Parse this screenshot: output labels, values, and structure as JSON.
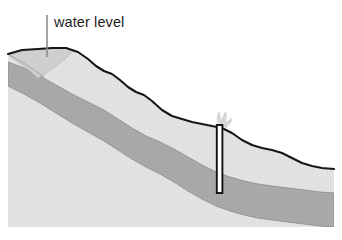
{
  "figure": {
    "width": 342,
    "height": 240,
    "background": "#ffffff"
  },
  "annotations": {
    "water_level": {
      "label": "water level",
      "text_x": 54,
      "text_y": 27,
      "leader_line": {
        "x": 47,
        "y_top": 15,
        "y_bottom": 57,
        "color": "#8c8c8c",
        "width": 1.6
      }
    }
  },
  "layers": {
    "surface_line": {
      "name": "ground-surface",
      "color": "#161616",
      "width": 2.1
    },
    "unsaturated_zone": {
      "name": "upper-soil",
      "color": "#e2e2e2",
      "edge": "#c9c9c9"
    },
    "saturated_wedge": {
      "name": "water-table-wedge",
      "color": "#cfcfcf",
      "edge": "#b3b3b3"
    },
    "aquifer": {
      "name": "confined-aquifer",
      "color": "#a9a9a9",
      "edge": "#8f8f8f"
    },
    "bedrock": {
      "name": "lower-bedrock",
      "color": "#e2e2e2",
      "edge": "#cccccc"
    }
  },
  "well": {
    "name": "artesian-well",
    "x_left": 216.5,
    "x_right": 222.5,
    "y_top": 125,
    "y_bottom": 193,
    "casing_color": "#111111",
    "bore_color": "#ffffff",
    "casing_width": 2.0
  },
  "plume": {
    "name": "water-spray",
    "color": "#d2d2d2",
    "x": 220,
    "y_top": 112,
    "y_base": 127
  },
  "geometry": {
    "ground_surface_path": "M 8,54 L 22,50 L 38,49 L 52,48 L 66,48 L 78,52 L 88,59 L 96,66 L 104,71 L 112,74 L 120,80 L 128,87 L 136,92 L 144,95 L 152,101 L 162,110 L 172,116 L 182,119 L 192,122 L 202,124 L 212,126 L 222,128 L 232,133 L 242,140 L 252,145 L 262,148 L 272,150 L 282,153 L 292,158 L 302,163 L 312,166 L 322,168 L 334,169",
    "aquifer_top_path": "M 8,62 L 24,68 L 40,76 L 56,85 L 72,94 L 88,102 L 104,110 L 118,119 L 132,128 L 146,136 L 160,142 L 174,149 L 188,157 L 202,165 L 216,172 L 230,177 L 244,181 L 258,184 L 272,186 L 288,188 L 304,190 L 320,192 L 334,193",
    "aquifer_bottom_path": "M 8,86 L 24,94 L 40,103 L 56,113 L 72,123 L 88,132 L 104,141 L 118,150 L 132,159 L 146,167 L 160,174 L 174,182 L 188,191 L 202,199 L 216,206 L 230,211 L 244,215 L 258,218 L 272,220 L 288,222 L 304,224 L 320,226 L 334,227",
    "wedge_path": "M 10,53 L 26,52 L 42,51 L 56,51 L 68,52 L 62,60 L 52,68 L 42,75 L 32,70 L 20,62 L 10,56 Z",
    "body_bottom_y": 227,
    "body_left_x": 8,
    "body_right_x": 334
  }
}
